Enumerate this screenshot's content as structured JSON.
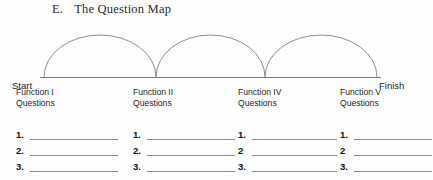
{
  "document": {
    "section_letter": "E.",
    "section_title": "The Question Map"
  },
  "diagram": {
    "start_label": "Start",
    "finish_label": "Finish",
    "arc_count": 3,
    "line_color": "#8d8d8d",
    "baseline_color": "#7a7a7a"
  },
  "columns": [
    {
      "header_line1": "Function I",
      "header_line2": "Questions",
      "items": [
        "1.",
        "2.",
        "3."
      ]
    },
    {
      "header_line1": "Function II",
      "header_line2": "Questions",
      "items": [
        "1.",
        "2.",
        "3."
      ]
    },
    {
      "header_line1": "Function IV",
      "header_line2": "Questions",
      "items": [
        "1.",
        "2",
        "3."
      ]
    },
    {
      "header_line1": "Function V",
      "header_line2": "Questions",
      "items": [
        "1.",
        "2",
        "3."
      ]
    }
  ]
}
